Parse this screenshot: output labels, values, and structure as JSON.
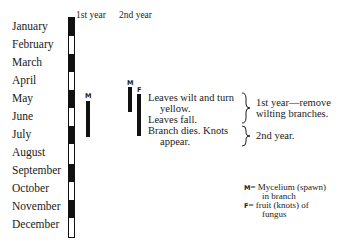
{
  "headers": {
    "first_year": "1st year",
    "second_year": "2nd year"
  },
  "months": [
    "January",
    "February",
    "March",
    "April",
    "May",
    "June",
    "July",
    "August",
    "September",
    "October",
    "November",
    "December"
  ],
  "markers": {
    "m1": "M",
    "m2": "M",
    "f": "F"
  },
  "notes": {
    "line1": "Leaves wilt and turn",
    "line2": "yellow.",
    "line3": "Leaves fall.",
    "line4": "Branch dies.  Knots",
    "line5": "appear."
  },
  "actions": {
    "first_line1": "1st year—remove",
    "first_line2": "wilting branches.",
    "second": "2nd year."
  },
  "legend": {
    "m_key": "M",
    "m_text": "= Mycelium (spawn)",
    "m_text2": "in branch",
    "f_key": "F",
    "f_text": "= fruit (knots) of",
    "f_text2": "fungus"
  }
}
